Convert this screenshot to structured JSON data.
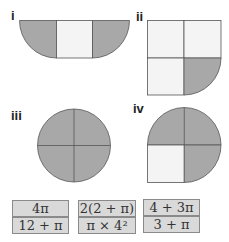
{
  "figures": [
    {
      "label": "i",
      "description": "rectangle with semicircular ends; two end half-discs shaded, middle square unshaded"
    },
    {
      "label": "ii",
      "description": "2x2 square grid; bottom-right quarter replaced by shaded quarter-circle"
    },
    {
      "label": "iii",
      "description": "full circle divided into four shaded quarters"
    },
    {
      "label": "iv",
      "description": "top semicircle shaded, bottom-left square unshaded, bottom-right quarter-circle shaded"
    }
  ],
  "answers": [
    {
      "text": "4π"
    },
    {
      "text": "2(2 + π)"
    },
    {
      "text": "4 + 3π"
    },
    {
      "text": "12 + π"
    },
    {
      "text": "π × 4²"
    },
    {
      "text": "3 + π"
    }
  ],
  "colors": {
    "shaded": "#a8a8a8",
    "unshaded": "#f4f4f4",
    "stroke": "#555555",
    "answer_bg": "#d9d9d9",
    "answer_border": "#8a8a8a"
  }
}
